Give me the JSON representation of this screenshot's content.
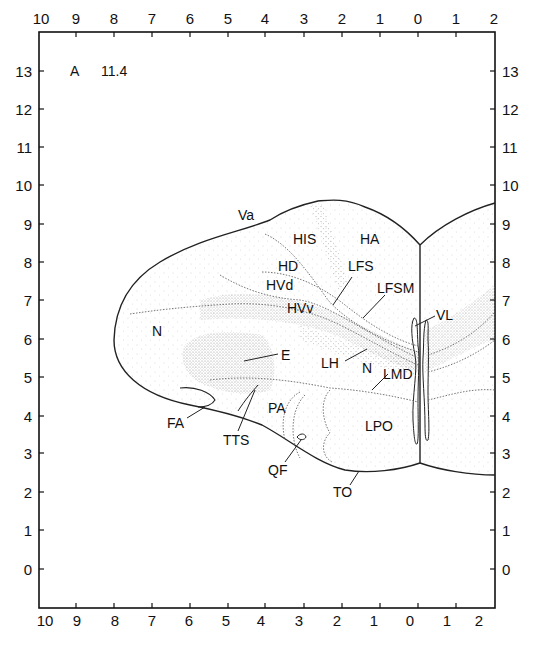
{
  "figure": {
    "plate_letter": "A",
    "plate_number": "11.4"
  },
  "axes": {
    "top_ticks": [
      "10",
      "9",
      "8",
      "7",
      "6",
      "5",
      "4",
      "3",
      "2",
      "1",
      "0",
      "1",
      "2"
    ],
    "bottom_ticks": [
      "10",
      "9",
      "8",
      "7",
      "6",
      "5",
      "4",
      "3",
      "2",
      "1",
      "0",
      "1",
      "2"
    ],
    "left_ticks": [
      "13",
      "12",
      "11",
      "10",
      "9",
      "8",
      "7",
      "6",
      "5",
      "4",
      "3",
      "2",
      "1",
      "0"
    ],
    "right_ticks": [
      "13",
      "12",
      "11",
      "10",
      "9",
      "8",
      "7",
      "6",
      "5",
      "4",
      "3",
      "2",
      "1",
      "0"
    ]
  },
  "regions": [
    {
      "id": "Va",
      "label": "Va"
    },
    {
      "id": "HIS",
      "label": "HIS"
    },
    {
      "id": "HA",
      "label": "HA"
    },
    {
      "id": "HD",
      "label": "HD"
    },
    {
      "id": "LFS",
      "label": "LFS"
    },
    {
      "id": "HVd",
      "label": "HVd"
    },
    {
      "id": "LFSM",
      "label": "LFSM"
    },
    {
      "id": "HVv",
      "label": "HVv"
    },
    {
      "id": "VL",
      "label": "VL"
    },
    {
      "id": "N1",
      "label": "N"
    },
    {
      "id": "E",
      "label": "E"
    },
    {
      "id": "LH",
      "label": "LH"
    },
    {
      "id": "N2",
      "label": "N"
    },
    {
      "id": "LMD",
      "label": "LMD"
    },
    {
      "id": "FA",
      "label": "FA"
    },
    {
      "id": "PA",
      "label": "PA"
    },
    {
      "id": "LPO",
      "label": "LPO"
    },
    {
      "id": "TTS",
      "label": "TTS"
    },
    {
      "id": "QF",
      "label": "QF"
    },
    {
      "id": "TO",
      "label": "TO"
    }
  ]
}
